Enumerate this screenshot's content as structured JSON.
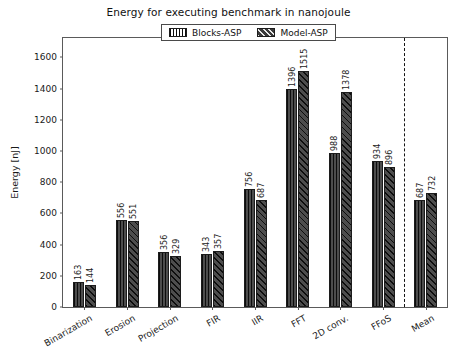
{
  "chart_data": {
    "type": "bar",
    "title": "Energy for executing benchmark in nanojoule",
    "xlabel": "",
    "ylabel": "Energy [nJ]",
    "categories": [
      "Binarization",
      "Erosion",
      "Projection",
      "FIR",
      "IIR",
      "FFT",
      "2D conv.",
      "FFoS",
      "Mean"
    ],
    "series": [
      {
        "name": "Blocks-ASP",
        "hatch": "vertical",
        "color": "#4d4d4d",
        "values": [
          163,
          556,
          356,
          343,
          756,
          1396,
          988,
          934,
          687
        ]
      },
      {
        "name": "Model-ASP",
        "hatch": "diagonal",
        "color": "#4d4d4d",
        "values": [
          144,
          551,
          329,
          357,
          687,
          1515,
          1378,
          896,
          732
        ]
      }
    ],
    "ylim": [
      0,
      1725
    ],
    "yticks": [
      0,
      200,
      400,
      600,
      800,
      1000,
      1200,
      1400,
      1600
    ],
    "ytick_labels": [
      "0",
      "200",
      "400",
      "600",
      "800",
      "1000",
      "1200",
      "1400",
      "1600"
    ],
    "grid": false,
    "legend_position": "upper center",
    "annotations": [
      {
        "type": "vertical-dashed-line",
        "name": "mean-separator",
        "between": [
          "FFoS",
          "Mean"
        ],
        "style": "dashed",
        "color": "#141414"
      }
    ],
    "value_labels": {
      "shown": true,
      "rotation": 90
    },
    "xtick_rotation": -30
  }
}
